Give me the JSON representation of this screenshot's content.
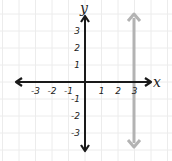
{
  "chart_data": {
    "type": "line",
    "title": "",
    "xlabel": "x",
    "ylabel": "y",
    "xlim": [
      -4,
      4
    ],
    "ylim": [
      -4,
      4
    ],
    "grid": true,
    "x_ticks": [
      "-3",
      "-2",
      "-1",
      "1",
      "2",
      "3"
    ],
    "y_ticks": [
      "3",
      "2",
      "1",
      "-1",
      "-2",
      "-3"
    ],
    "series": [
      {
        "name": "x = 3",
        "kind": "vertical-line",
        "x": [
          3,
          3
        ],
        "y": [
          -4,
          4
        ],
        "color": "#b3b3b3",
        "arrows": "both"
      }
    ]
  },
  "colors": {
    "axes": "#1a1a1a",
    "grid": "#ececec",
    "line": "#b3b3b3"
  }
}
